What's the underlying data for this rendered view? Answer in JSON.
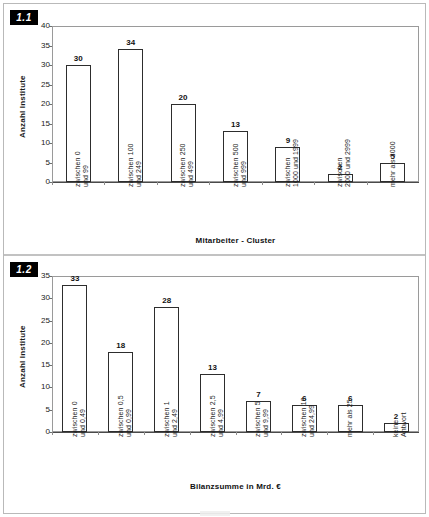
{
  "document": {
    "background": "#ffffff",
    "border_color": "#b9b9b9"
  },
  "panels": [
    {
      "badge": "1.1",
      "chart_data": {
        "type": "bar",
        "title": "",
        "xlabel": "Mitarbeiter - Cluster",
        "ylabel": "Anzahl Institute",
        "ylim": [
          0,
          40
        ],
        "ytick_step": 5,
        "yticks": [
          0,
          5,
          10,
          15,
          20,
          25,
          30,
          35,
          40
        ],
        "grid": false,
        "legend": "none",
        "bar_facecolor": "#ffffff",
        "bar_edgecolor": "#2d2d2d",
        "show_values": true,
        "categories": [
          "zwischen 0 und 99",
          "zwischen 100 und 249",
          "zwischen 250 und 499",
          "zwischen 500 und 999",
          "zwischen 1000 und 1999",
          "zwischen 2000 und 2999",
          "mehr als 3000"
        ],
        "category_lines": [
          [
            "zwischen 0",
            "und 99"
          ],
          [
            "zwischen 100",
            "und 249"
          ],
          [
            "zwischen 250",
            "und 499"
          ],
          [
            "zwischen 500",
            "und 999"
          ],
          [
            "zwischen",
            "1000 und 1999"
          ],
          [
            "zwischen",
            "2000 und 2999"
          ],
          [
            "mehr als 3000",
            ""
          ]
        ],
        "values": [
          30,
          34,
          20,
          13,
          9,
          2,
          5
        ]
      }
    },
    {
      "badge": "1.2",
      "chart_data": {
        "type": "bar",
        "title": "",
        "xlabel": "Bilanzsumme in Mrd. €",
        "ylabel": "Anzahl Institute",
        "ylim": [
          0,
          35
        ],
        "ytick_step": 5,
        "yticks": [
          0,
          5,
          10,
          15,
          20,
          25,
          30,
          35
        ],
        "grid": false,
        "legend": "none",
        "bar_facecolor": "#ffffff",
        "bar_edgecolor": "#2d2d2d",
        "show_values": true,
        "categories": [
          "zwischen 0 und 0,49",
          "zwischen 0,5 und 0,99",
          "zwischen 1 und 2,49",
          "zwischen 2,5 und 4,99",
          "zwischen 5 und 9,99",
          "zwischen 10 und 24,99",
          "mehr als 25",
          "keine Antwort"
        ],
        "category_lines": [
          [
            "zwischen 0",
            "und 0,49"
          ],
          [
            "zwischen 0,5",
            "und 0,99"
          ],
          [
            "zwischen 1",
            "und 2,49"
          ],
          [
            "zwischen 2,5",
            "und 4,99"
          ],
          [
            "zwischen 5",
            "und 9,99"
          ],
          [
            "zwischen 10",
            "und 24,99"
          ],
          [
            "mehr als 25",
            ""
          ],
          [
            "keine",
            "Antwort"
          ]
        ],
        "values": [
          33,
          18,
          28,
          13,
          7,
          6,
          6,
          2
        ]
      }
    }
  ]
}
